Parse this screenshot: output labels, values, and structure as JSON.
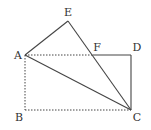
{
  "diagram": {
    "type": "geometry",
    "stroke_color": "#444444",
    "points": {
      "A": {
        "x": 25,
        "y": 55,
        "label": "A",
        "lx": 18,
        "ly": 59
      },
      "B": {
        "x": 25,
        "y": 110,
        "label": "B",
        "lx": 19,
        "ly": 121
      },
      "C": {
        "x": 131,
        "y": 110,
        "label": "C",
        "lx": 137,
        "ly": 121
      },
      "D": {
        "x": 131,
        "y": 55,
        "label": "D",
        "lx": 137,
        "ly": 51
      },
      "E": {
        "x": 68,
        "y": 21,
        "label": "E",
        "lx": 68,
        "ly": 16
      },
      "F": {
        "x": 93,
        "y": 55,
        "label": "F",
        "lx": 97,
        "ly": 51
      }
    },
    "segments_solid": [
      [
        "A",
        "E"
      ],
      [
        "E",
        "C"
      ],
      [
        "A",
        "C"
      ],
      [
        "F",
        "D"
      ],
      [
        "D",
        "C"
      ]
    ],
    "segments_dashed": [
      [
        "A",
        "F"
      ],
      [
        "A",
        "B"
      ],
      [
        "B",
        "C"
      ]
    ]
  }
}
